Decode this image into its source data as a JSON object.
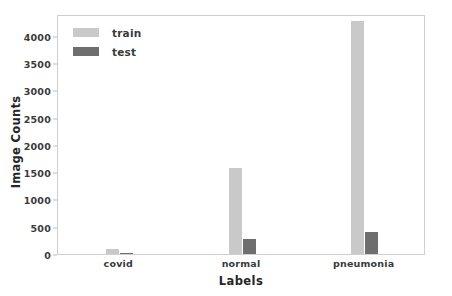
{
  "chart_data": {
    "type": "bar",
    "title": "",
    "xlabel": "Labels",
    "ylabel": "Image Counts",
    "categories": [
      "covid",
      "normal",
      "pneumonia"
    ],
    "series": [
      {
        "name": "train",
        "color": "#c9c9c9",
        "values": [
          100,
          1580,
          4270
        ]
      },
      {
        "name": "test",
        "color": "#6e6e6e",
        "values": [
          20,
          270,
          400
        ]
      }
    ],
    "ylim": [
      0,
      4400
    ],
    "yticks": [
      0,
      500,
      1000,
      1500,
      2000,
      2500,
      3000,
      3500,
      4000
    ],
    "ytick_labels": [
      "0",
      "500",
      "1000",
      "1500",
      "2000",
      "2500",
      "3000",
      "3500",
      "4000"
    ],
    "xtick_labels": [
      "covid",
      "normal",
      "pneumonia"
    ],
    "grid": false,
    "legend_position": "upper left",
    "legend_entries": [
      "train",
      "test"
    ]
  },
  "figure": {
    "background_color": "#ffffff",
    "axes_edge_color": "#cfcfcf",
    "tick_label_color": "#3a3a3a",
    "axis_label_color": "#262626"
  }
}
